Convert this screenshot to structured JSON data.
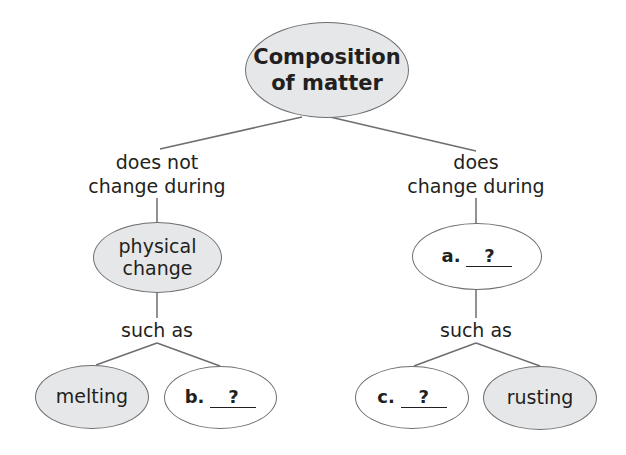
{
  "diagram": {
    "type": "concept-map",
    "root": {
      "label": "Composition of matter",
      "line1": "Composition",
      "line2": "of matter",
      "shaded": true
    },
    "left_branch": {
      "link_label": "does not change during",
      "link_line1": "does not",
      "link_line2": "change during",
      "node": {
        "label": "physical change",
        "line1": "physical",
        "line2": "change",
        "shaded": true
      },
      "sub_link_label": "such as",
      "children": [
        {
          "label": "melting",
          "shaded": true
        },
        {
          "prefix": "b.",
          "answer": "?",
          "shaded": false
        }
      ]
    },
    "right_branch": {
      "link_label": "does change during",
      "link_line1": "does",
      "link_line2": "change during",
      "node": {
        "prefix": "a.",
        "answer": "?",
        "shaded": false
      },
      "sub_link_label": "such as",
      "children": [
        {
          "prefix": "c.",
          "answer": "?",
          "shaded": false
        },
        {
          "label": "rusting",
          "shaded": true
        }
      ]
    },
    "colors": {
      "shaded_fill": "#e6e7e8",
      "blank_fill": "#ffffff",
      "stroke": "#6d6e71",
      "text": "#231f20"
    }
  }
}
